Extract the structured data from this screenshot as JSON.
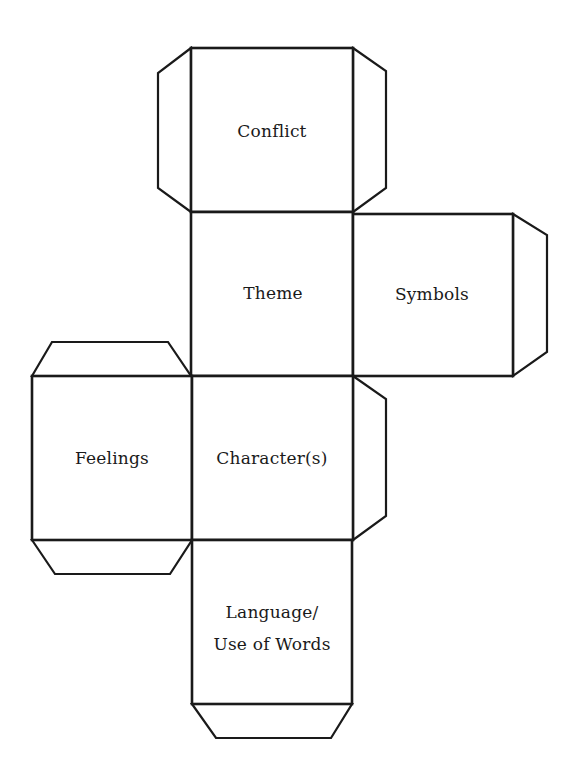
{
  "diagram": {
    "type": "cube-net",
    "stroke_color": "#1a1a1a",
    "background": "#ffffff",
    "faces": [
      {
        "id": "conflict",
        "label_lines": [
          "Conflict"
        ]
      },
      {
        "id": "theme",
        "label_lines": [
          "Theme"
        ]
      },
      {
        "id": "symbols",
        "label_lines": [
          "Symbols"
        ]
      },
      {
        "id": "feelings",
        "label_lines": [
          "Feelings"
        ]
      },
      {
        "id": "character",
        "label_lines": [
          "Character(s)"
        ]
      },
      {
        "id": "language",
        "label_lines": [
          "Language/",
          "Use of Words"
        ]
      }
    ],
    "tabs": [
      "conflict-left-tab",
      "conflict-right-tab",
      "symbols-right-tab",
      "feelings-top-tab",
      "feelings-bottom-tab",
      "character-right-tab",
      "language-bottom-tab"
    ]
  }
}
